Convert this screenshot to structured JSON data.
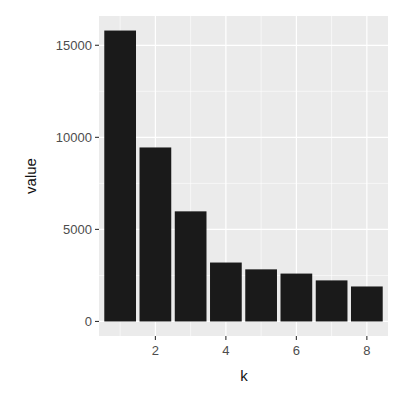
{
  "chart_data": {
    "type": "bar",
    "title": "",
    "xlabel": "k",
    "ylabel": "value",
    "categories": [
      1,
      2,
      3,
      4,
      5,
      6,
      7,
      8
    ],
    "values": [
      15800,
      9450,
      5980,
      3200,
      2830,
      2600,
      2230,
      1900
    ],
    "xlim": [
      0.4,
      8.6
    ],
    "ylim": [
      -790,
      16590
    ],
    "x_ticks": [
      2,
      4,
      6,
      8
    ],
    "y_ticks": [
      0,
      5000,
      10000,
      15000
    ],
    "grid": true,
    "legend": null,
    "bar_color": "#1a1a1a",
    "panel_background": "#ebebeb",
    "grid_color": "#ffffff"
  }
}
